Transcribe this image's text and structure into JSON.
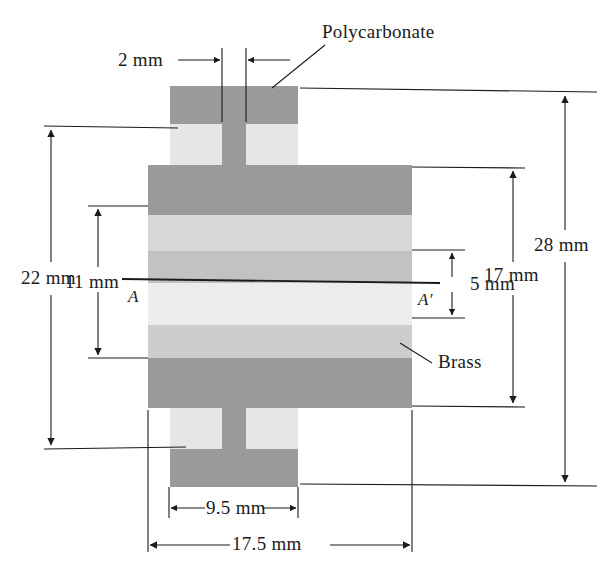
{
  "figure": {
    "type": "engineering-cross-section-diagram",
    "background_color": "#ffffff",
    "line_color": "#1b1b1b"
  },
  "materials": [
    {
      "name": "Polycarbonate",
      "color": "#9a9a9a",
      "label": "Polycarbonate"
    },
    {
      "name": "Brass",
      "color": "#cfcfcf",
      "label": "Brass"
    }
  ],
  "labels": {
    "polycarbonate": "Polycarbonate",
    "brass": "Brass",
    "section_left": "A",
    "section_right": "A′"
  },
  "dimensions": [
    {
      "id": "d_2mm",
      "label": "2 mm",
      "orientation": "horizontal",
      "location": "top-center"
    },
    {
      "id": "d_22mm",
      "label": "22 mm",
      "orientation": "vertical",
      "location": "left-outer"
    },
    {
      "id": "d_11mm",
      "label": "11 mm",
      "orientation": "vertical",
      "location": "left-inner"
    },
    {
      "id": "d_5mm",
      "label": "5 mm",
      "orientation": "vertical",
      "location": "right-inner"
    },
    {
      "id": "d_17mm",
      "label": "17 mm",
      "orientation": "vertical",
      "location": "right-middle"
    },
    {
      "id": "d_28mm",
      "label": "28 mm",
      "orientation": "vertical",
      "location": "right-outer"
    },
    {
      "id": "d_95mm",
      "label": "9.5 mm",
      "orientation": "horizontal",
      "location": "bottom-inner"
    },
    {
      "id": "d_175mm",
      "label": "17.5 mm",
      "orientation": "horizontal",
      "location": "bottom-outer"
    }
  ],
  "bands": [
    {
      "index": 0,
      "material": "Polycarbonate",
      "color": "#9a9a9a",
      "y": 165,
      "height": 50
    },
    {
      "index": 1,
      "material": "Brass",
      "color": "#d8d8d8",
      "y": 215,
      "height": 36
    },
    {
      "index": 2,
      "material": "Brass",
      "color": "#c2c2c2",
      "y": 251,
      "height": 32
    },
    {
      "index": 3,
      "material": "Brass",
      "color": "#ececec",
      "y": 283,
      "height": 42
    },
    {
      "index": 4,
      "material": "Brass",
      "color": "#cdcdcd",
      "y": 325,
      "height": 33
    },
    {
      "index": 5,
      "material": "Polycarbonate",
      "color": "#9a9a9a",
      "y": 358,
      "height": 50
    }
  ],
  "geometry": {
    "main_block": {
      "x": 148,
      "y": 165,
      "width": 264,
      "height": 243
    },
    "top_tab": {
      "x": 170,
      "y": 86,
      "width": 128,
      "height": 79
    },
    "bottom_tab": {
      "x": 170,
      "y": 408,
      "width": 128,
      "height": 79
    },
    "center_strip_width": 24,
    "notch_color": "#e6e6e6",
    "tab_color": "#9a9a9a"
  }
}
